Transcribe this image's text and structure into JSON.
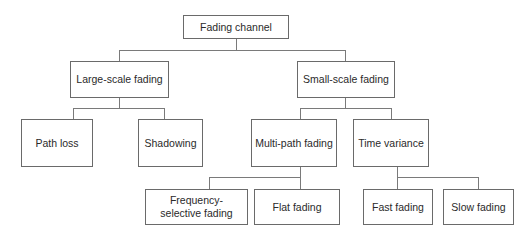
{
  "diagram": {
    "nodes": {
      "root": "Fading channel",
      "large_scale": "Large-scale fading",
      "small_scale": "Small-scale fading",
      "path_loss": "Path loss",
      "shadowing": "Shadowing",
      "multipath": "Multi-path fading",
      "time_variance": "Time variance",
      "freq_selective": "Frequency-selective fading",
      "flat": "Flat fading",
      "fast": "Fast fading",
      "slow": "Slow fading"
    },
    "edges": [
      [
        "Fading channel",
        "Large-scale fading"
      ],
      [
        "Fading channel",
        "Small-scale fading"
      ],
      [
        "Large-scale fading",
        "Path loss"
      ],
      [
        "Large-scale fading",
        "Shadowing"
      ],
      [
        "Small-scale fading",
        "Multi-path fading"
      ],
      [
        "Small-scale fading",
        "Time variance"
      ],
      [
        "Multi-path fading",
        "Frequency-selective fading"
      ],
      [
        "Multi-path fading",
        "Flat fading"
      ],
      [
        "Time variance",
        "Fast fading"
      ],
      [
        "Time variance",
        "Slow fading"
      ]
    ]
  }
}
